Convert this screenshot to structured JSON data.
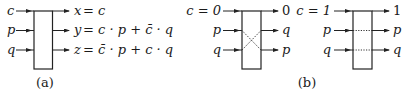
{
  "diagram_a": {
    "caption": "(a)",
    "inputs": [
      "c",
      "p",
      "q"
    ],
    "outputs": [
      {
        "var": "x",
        "eq": "= c"
      },
      {
        "var": "y",
        "eq": "= c · p + c̄ · q"
      },
      {
        "var": "z",
        "eq": "= c̄ · p + c · q"
      }
    ]
  },
  "diagram_b": {
    "caption": "(b)",
    "left": {
      "inputs": [
        "c = 0",
        "p",
        "q"
      ],
      "outputs": [
        "0",
        "q",
        "p"
      ],
      "internal": "crossed"
    },
    "right": {
      "inputs": [
        "c = 1",
        "p",
        "q"
      ],
      "outputs": [
        "1",
        "p",
        "q"
      ],
      "internal": "straight"
    }
  },
  "colors": {
    "ink": "#222222",
    "background": "#ffffff"
  }
}
